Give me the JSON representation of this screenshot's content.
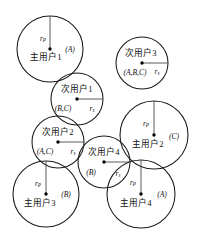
{
  "diagram": {
    "type": "network-coverage-venn",
    "canvas": {
      "width": 201,
      "height": 244,
      "background": "#ffffff"
    },
    "stroke_color": "#1a1a1a",
    "radius_line_color": "#4a4a4a",
    "nodes": [
      {
        "id": "primary-user-1",
        "label": "主用户1",
        "set_label": "(A)",
        "radius_symbol": "r",
        "radius_subscript": "P",
        "cx": 50,
        "cy": 49,
        "r": 33,
        "label_dx": -4,
        "label_dy": 9,
        "set_dx": 20,
        "set_dy": 1,
        "radius_dir": "up",
        "radius_label_dx": -7,
        "radius_label_dy": -10
      },
      {
        "id": "secondary-user-3",
        "label": "次用户3",
        "set_label": "(A,B,C)",
        "radius_symbol": "r",
        "radius_subscript": "s",
        "cx": 142,
        "cy": 63,
        "r": 26,
        "label_dx": -1,
        "label_dy": -9,
        "set_dx": -7,
        "set_dy": 10,
        "radius_dir": "right",
        "radius_label_dx": 15,
        "radius_label_dy": 9
      },
      {
        "id": "secondary-user-1",
        "label": "次用户1",
        "set_label": "(B,C)",
        "radius_symbol": "r",
        "radius_subscript": "s",
        "cx": 77,
        "cy": 99,
        "r": 26,
        "label_dx": 0,
        "label_dy": -9,
        "set_dx": -14,
        "set_dy": 10,
        "radius_dir": "right",
        "radius_label_dx": 15,
        "radius_label_dy": 10
      },
      {
        "id": "primary-user-2",
        "label": "主用户2",
        "set_label": "(C)",
        "radius_symbol": "r",
        "radius_subscript": "P",
        "cx": 154,
        "cy": 135,
        "r": 34,
        "label_dx": -6,
        "label_dy": 10,
        "set_dx": 20,
        "set_dy": 2,
        "radius_dir": "up",
        "radius_label_dx": -8,
        "radius_label_dy": -11
      },
      {
        "id": "secondary-user-2",
        "label": "次用户2",
        "set_label": "(A,C)",
        "radius_symbol": "r",
        "radius_subscript": "s",
        "cx": 58,
        "cy": 142,
        "r": 26,
        "label_dx": 0,
        "label_dy": -9,
        "set_dx": -13,
        "set_dy": 10,
        "radius_dir": "right",
        "radius_label_dx": 15,
        "radius_label_dy": 10
      },
      {
        "id": "secondary-user-4",
        "label": "次用户4",
        "set_label": "(B)",
        "radius_symbol": "r",
        "radius_subscript": "s",
        "cx": 104,
        "cy": 162,
        "r": 26,
        "label_dx": 0,
        "label_dy": -9,
        "set_dx": -13,
        "set_dy": 11,
        "radius_dir": "right",
        "radius_label_dx": 14,
        "radius_label_dy": 12
      },
      {
        "id": "primary-user-3",
        "label": "主用户3",
        "set_label": "(B)",
        "radius_symbol": "r",
        "radius_subscript": "P",
        "cx": 46,
        "cy": 194,
        "r": 33,
        "label_dx": -6,
        "label_dy": 10,
        "set_dx": 20,
        "set_dy": 1,
        "radius_dir": "up",
        "radius_label_dx": -8,
        "radius_label_dy": -10
      },
      {
        "id": "primary-user-4",
        "label": "主用户4",
        "set_label": "(A)",
        "radius_symbol": "r",
        "radius_subscript": "P",
        "cx": 141,
        "cy": 194,
        "r": 34,
        "label_dx": -5,
        "label_dy": 10,
        "set_dx": 21,
        "set_dy": 1,
        "radius_dir": "up",
        "radius_label_dx": -8,
        "radius_label_dy": -11
      }
    ]
  }
}
